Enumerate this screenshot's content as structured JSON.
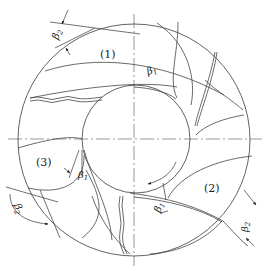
{
  "diagram": {
    "type": "impeller-blade-profile",
    "labels": {
      "region_1": "(1)",
      "region_2": "(2)",
      "region_3": "(3)"
    },
    "angles": {
      "beta1_symbol": "β",
      "beta1_sub": "1",
      "beta2_symbol": "β",
      "beta2_sub": "2"
    },
    "rotation_direction": "clockwise",
    "geometry": {
      "outer_circle": {
        "cx": 134,
        "cy": 140,
        "r": 116
      },
      "hub_circle": {
        "cx": 134,
        "cy": 140,
        "r": 54
      },
      "centerlines": [
        "horizontal",
        "vertical"
      ]
    },
    "colors": {
      "line": "#3a3a3a",
      "background": "#ffffff"
    }
  }
}
